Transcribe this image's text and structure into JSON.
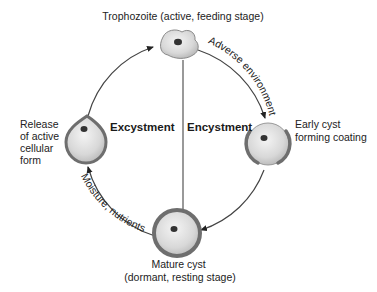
{
  "diagram": {
    "type": "life-cycle",
    "stages": {
      "trophozoite": {
        "label": "Trophozoite (active, feeding stage)"
      },
      "early_cyst": {
        "label_lines": [
          "Early cyst",
          "forming coating"
        ]
      },
      "mature_cyst": {
        "label_lines": [
          "Mature cyst",
          "(dormant, resting stage)"
        ]
      },
      "release": {
        "label_lines": [
          "Release",
          "of active",
          "cellular",
          "form"
        ]
      }
    },
    "processes": {
      "excystment": "Excystment",
      "encystment": "Encystment"
    },
    "arrows": {
      "adverse": "Adverse environment",
      "moisture": "Moisture, nutrients"
    },
    "colors": {
      "line": "#555555",
      "cell_fill": "#dcdcdc",
      "cell_rim": "#7a7a7a",
      "nucleus": "#333333"
    }
  }
}
